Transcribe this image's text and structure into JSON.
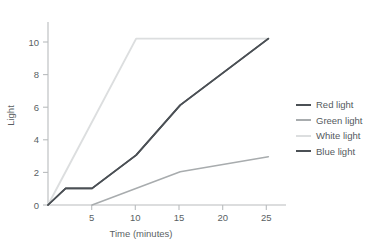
{
  "chart_data": {
    "type": "line",
    "title": "",
    "xlabel": "Time (minutes)",
    "ylabel": "Light",
    "xlim": [
      0,
      27
    ],
    "ylim": [
      0,
      11
    ],
    "xticks": [
      5,
      10,
      15,
      20,
      25
    ],
    "yticks": [
      0,
      2,
      4,
      6,
      8,
      10
    ],
    "grid": false,
    "legend_position": "right",
    "series": [
      {
        "name": "Red light",
        "color": "#4b5055",
        "x": [
          0,
          2,
          5,
          10,
          15,
          25
        ],
        "values": [
          0,
          1,
          1,
          3,
          6,
          10
        ]
      },
      {
        "name": "Green light",
        "color": "#a8acae",
        "x": [
          5,
          15,
          25
        ],
        "values": [
          0,
          2,
          2.9
        ]
      },
      {
        "name": "White light",
        "color": "#dcdedf",
        "x": [
          0,
          10,
          25
        ],
        "values": [
          0,
          10,
          10
        ]
      },
      {
        "name": "Blue light",
        "color": "#4b5055",
        "x": [
          0,
          2,
          5,
          10,
          15,
          25
        ],
        "values": [
          0,
          1,
          1,
          3,
          6,
          10
        ]
      }
    ]
  },
  "legend": {
    "items": [
      {
        "label": "Red light",
        "color": "#4b5055"
      },
      {
        "label": "Green light",
        "color": "#a8acae"
      },
      {
        "label": "White light",
        "color": "#dcdedf"
      },
      {
        "label": "Blue light",
        "color": "#4b5055"
      }
    ]
  },
  "axes": {
    "x_tick_labels": [
      "5",
      "10",
      "15",
      "20",
      "25"
    ],
    "y_tick_labels": [
      "0",
      "2",
      "4",
      "6",
      "8",
      "10"
    ],
    "axis_color": "#b9bcbe"
  }
}
